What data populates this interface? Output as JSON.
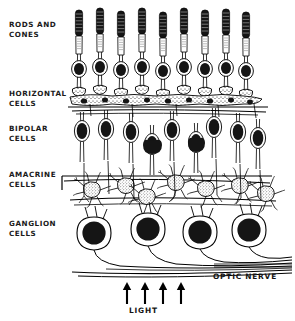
{
  "figure": {
    "background_color": "#ffffff",
    "ink_color": "#000000",
    "style": "hand-drawn pen and ink line diagram"
  },
  "layer_labels": [
    {
      "id": "rods",
      "text": "RODS AND\nCONES",
      "x": 9,
      "y": 20
    },
    {
      "id": "horizontal",
      "text": "HORIZONTAL\nCELLS",
      "x": 9,
      "y": 89
    },
    {
      "id": "bipolar",
      "text": "BIPOLAR\nCELLS",
      "x": 9,
      "y": 124
    },
    {
      "id": "amacrine",
      "text": "AMACRINE\nCELLS",
      "x": 9,
      "y": 170
    },
    {
      "id": "ganglion",
      "text": "GANGLION\nCELLS",
      "x": 9,
      "y": 219
    }
  ],
  "callouts": {
    "optic_nerve": "OPTIC NERVE",
    "light": "LIGHT"
  },
  "counts": {
    "photoreceptors": 9,
    "bipolar_cells": 9,
    "ganglion_cells": 4,
    "light_arrows": 4
  }
}
